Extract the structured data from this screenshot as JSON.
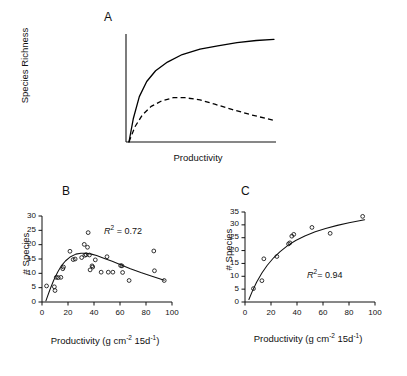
{
  "figure": {
    "panels": [
      {
        "letter": "A",
        "type": "conceptual",
        "ylabel": "Species Richness",
        "xlabel": "Productivity"
      },
      {
        "letter": "B",
        "ylabel": "# Species",
        "xlabel_main": "Productivity (g cm",
        "xlabel_sup1": "-2",
        "xlabel_mid": " 15d",
        "xlabel_sup2": "-1",
        "xlabel_end": ")",
        "r2_prefix": "R",
        "r2_sup": "2",
        "r2_value": "= 0.72"
      },
      {
        "letter": "C",
        "ylabel": "# Species",
        "xlabel_main": "Productivity (g cm",
        "xlabel_sup1": "-2",
        "xlabel_mid": " 15d",
        "xlabel_sup2": "-1",
        "xlabel_end": ")",
        "r2_prefix": "R",
        "r2_sup": "2",
        "r2_value": "= 0.94"
      }
    ]
  },
  "chart_data": [
    {
      "id": "panel-a",
      "type": "line",
      "title": "A",
      "xlabel": "Productivity",
      "ylabel": "Species Richness",
      "xlim": [
        0,
        100
      ],
      "ylim": [
        0,
        100
      ],
      "xticks": [],
      "yticks": [],
      "grid": false,
      "legend": "none",
      "series": [
        {
          "name": "monotonic saturating",
          "style": "solid",
          "color": "#000000",
          "x": [
            2,
            5,
            9,
            14,
            20,
            28,
            38,
            50,
            62,
            75,
            88,
            100
          ],
          "y": [
            0,
            22,
            42,
            56,
            66,
            74,
            81,
            86,
            89,
            92,
            94,
            95
          ]
        },
        {
          "name": "unimodal hump",
          "style": "dashed",
          "color": "#000000",
          "x": [
            2,
            6,
            11,
            17,
            24,
            32,
            40,
            50,
            60,
            72,
            85,
            100
          ],
          "y": [
            0,
            14,
            25,
            33,
            38,
            41,
            41,
            39,
            35,
            30,
            25,
            20
          ]
        }
      ]
    },
    {
      "id": "panel-b",
      "type": "scatter",
      "title": "B",
      "xlabel": "Productivity (g cm-2 15d-1)",
      "ylabel": "# Species",
      "xlim": [
        0,
        100
      ],
      "ylim": [
        0,
        30
      ],
      "xticks": [
        0,
        20,
        40,
        60,
        80,
        100
      ],
      "yticks": [
        0,
        5,
        10,
        15,
        20,
        25,
        30
      ],
      "grid": false,
      "legend": "none",
      "annotation": "R2 = 0.72",
      "marker": "open-circle",
      "points": [
        {
          "x": 3.5,
          "y": 5.6
        },
        {
          "x": 9.5,
          "y": 5.3
        },
        {
          "x": 10.0,
          "y": 4.0
        },
        {
          "x": 11.0,
          "y": 8.6
        },
        {
          "x": 12.5,
          "y": 8.5
        },
        {
          "x": 14.5,
          "y": 8.6
        },
        {
          "x": 16.0,
          "y": 11.6
        },
        {
          "x": 16.5,
          "y": 12.2
        },
        {
          "x": 21.5,
          "y": 17.7
        },
        {
          "x": 24.0,
          "y": 14.8
        },
        {
          "x": 25.5,
          "y": 15.0
        },
        {
          "x": 30.5,
          "y": 15.5
        },
        {
          "x": 32.5,
          "y": 20.1
        },
        {
          "x": 33.0,
          "y": 16.3
        },
        {
          "x": 34.0,
          "y": 16.5
        },
        {
          "x": 35.0,
          "y": 19.1
        },
        {
          "x": 35.5,
          "y": 24.2
        },
        {
          "x": 36.5,
          "y": 16.4
        },
        {
          "x": 37.0,
          "y": 11.2
        },
        {
          "x": 38.5,
          "y": 12.6
        },
        {
          "x": 39.0,
          "y": 12.2
        },
        {
          "x": 41.0,
          "y": 14.7
        },
        {
          "x": 45.5,
          "y": 10.4
        },
        {
          "x": 50.0,
          "y": 15.8
        },
        {
          "x": 51.0,
          "y": 10.4
        },
        {
          "x": 54.5,
          "y": 10.4
        },
        {
          "x": 60.5,
          "y": 12.7
        },
        {
          "x": 61.5,
          "y": 12.6
        },
        {
          "x": 62.0,
          "y": 10.3
        },
        {
          "x": 67.0,
          "y": 7.5
        },
        {
          "x": 86.0,
          "y": 17.8
        },
        {
          "x": 86.5,
          "y": 10.9
        },
        {
          "x": 94.0,
          "y": 7.5
        }
      ],
      "fit_curve": {
        "name": "unimodal fit",
        "style": "solid",
        "x": [
          3,
          6,
          9,
          12,
          15,
          18,
          22,
          26,
          30,
          34,
          38,
          42,
          48,
          54,
          60,
          68,
          76,
          84,
          94
        ],
        "y": [
          0.4,
          4.2,
          7.6,
          10.4,
          12.7,
          14.3,
          15.8,
          16.7,
          17.0,
          17.0,
          16.7,
          16.2,
          15.2,
          14.2,
          13.1,
          11.6,
          10.3,
          9.1,
          7.6
        ]
      }
    },
    {
      "id": "panel-c",
      "type": "scatter",
      "title": "C",
      "xlabel": "Productivity (g cm-2 15d-1)",
      "ylabel": "# Species",
      "xlim": [
        0,
        100
      ],
      "ylim": [
        0,
        35
      ],
      "xticks": [
        0,
        20,
        40,
        60,
        80,
        100
      ],
      "yticks": [
        0,
        5,
        10,
        15,
        20,
        25,
        30,
        35
      ],
      "grid": false,
      "legend": "none",
      "annotation": "R2 = 0.94",
      "marker": "open-circle",
      "points": [
        {
          "x": 6.5,
          "y": 5.2
        },
        {
          "x": 13.0,
          "y": 8.3
        },
        {
          "x": 14.5,
          "y": 16.8
        },
        {
          "x": 24.5,
          "y": 17.7
        },
        {
          "x": 33.5,
          "y": 22.6
        },
        {
          "x": 34.5,
          "y": 23.0
        },
        {
          "x": 36.0,
          "y": 25.6
        },
        {
          "x": 37.5,
          "y": 26.3
        },
        {
          "x": 51.5,
          "y": 29.0
        },
        {
          "x": 65.5,
          "y": 26.7
        },
        {
          "x": 90.5,
          "y": 33.3
        }
      ],
      "fit_curve": {
        "name": "saturating fit",
        "style": "solid",
        "x": [
          3,
          6,
          9,
          13,
          17,
          22,
          27,
          33,
          39,
          46,
          54,
          62,
          71,
          80,
          92
        ],
        "y": [
          1.0,
          4.6,
          7.8,
          11.3,
          14.2,
          17.2,
          19.6,
          22.0,
          23.9,
          25.7,
          27.3,
          28.6,
          29.8,
          30.8,
          32.0
        ]
      }
    }
  ]
}
